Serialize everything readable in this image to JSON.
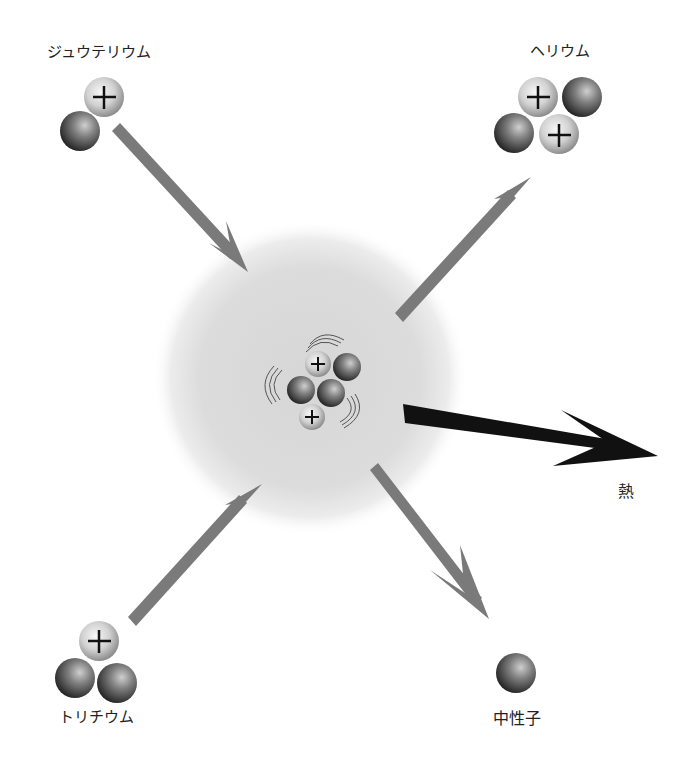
{
  "colors": {
    "arrow_gray": "#7a7a7a",
    "heat_arrow": "#111111",
    "glow": "#d9d9d9",
    "proton_light": "#f2f2f2",
    "proton_dark": "#9a9a9a",
    "neutron_light": "#bdbdbd",
    "neutron_dark": "#2a2a2a",
    "label_text": "#222222"
  },
  "particles": {
    "deuterium": {
      "label": "ジュウテリウム",
      "protons": 1,
      "neutrons": 1
    },
    "tritium": {
      "label": "トリチウム",
      "protons": 1,
      "neutrons": 2
    },
    "helium": {
      "label": "ヘリウム",
      "protons": 2,
      "neutrons": 2
    },
    "neutron": {
      "label": "中性子",
      "protons": 0,
      "neutrons": 1
    }
  },
  "energy": {
    "label": "熱"
  },
  "reaction": {
    "inputs": [
      "ジュウテリウム",
      "トリチウム"
    ],
    "outputs": [
      "ヘリウム",
      "中性子",
      "熱"
    ],
    "center": "fusing nucleus (2 protons, 3 neutrons) with vibration marks"
  },
  "symbols": {
    "proton_mark": "+"
  }
}
